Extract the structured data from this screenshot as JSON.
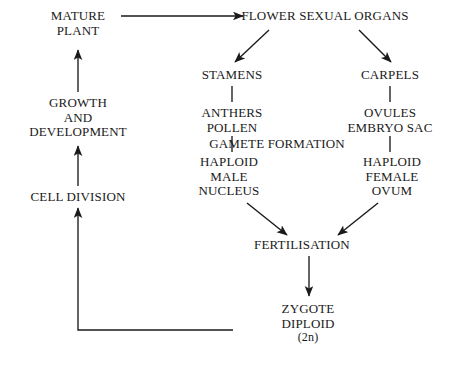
{
  "diagram": {
    "background_color": "#ffffff",
    "line_color": "#1a1a1a",
    "nodes": {
      "mature_plant": {
        "line1": "MATURE",
        "line2": "PLANT"
      },
      "flower_organs": {
        "line1": "FLOWER SEXUAL ORGANS"
      },
      "stamens": {
        "line1": "STAMENS"
      },
      "carpels": {
        "line1": "CARPELS"
      },
      "anthers": {
        "line1": "ANTHERS",
        "line2": "POLLEN"
      },
      "ovules": {
        "line1": "OVULES",
        "line2": "EMBRYO SAC"
      },
      "gamete_formation": {
        "line1": "GAMETE FORMATION"
      },
      "haploid_male": {
        "line1": "HAPLOID",
        "line2": "MALE",
        "line3": "NUCLEUS"
      },
      "haploid_female": {
        "line1": "HAPLOID",
        "line2": "FEMALE",
        "line3": "OVUM"
      },
      "fertilisation": {
        "line1": "FERTILISATION"
      },
      "zygote": {
        "line1": "ZYGOTE",
        "line2": "DIPLOID",
        "line3": "(2n)"
      },
      "growth": {
        "line1": "GROWTH",
        "line2": "AND",
        "line3": "DEVELOPMENT"
      },
      "cell_division": {
        "line1": "CELL DIVISION"
      }
    },
    "edges": [
      {
        "from": "mature_plant",
        "to": "flower_organs",
        "style": "arrow-right"
      },
      {
        "from": "flower_organs",
        "to": "stamens",
        "style": "arrow-diagonal-left"
      },
      {
        "from": "flower_organs",
        "to": "carpels",
        "style": "arrow-diagonal-right"
      },
      {
        "from": "stamens",
        "to": "anthers",
        "style": "plain-vertical"
      },
      {
        "from": "carpels",
        "to": "ovules",
        "style": "plain-vertical"
      },
      {
        "from": "anthers",
        "to": "haploid_male",
        "style": "plain-vertical"
      },
      {
        "from": "ovules",
        "to": "haploid_female",
        "style": "plain-vertical"
      },
      {
        "from": "haploid_male",
        "to": "fertilisation",
        "style": "arrow-diagonal-right"
      },
      {
        "from": "haploid_female",
        "to": "fertilisation",
        "style": "arrow-diagonal-left"
      },
      {
        "from": "fertilisation",
        "to": "zygote",
        "style": "arrow-down"
      },
      {
        "from": "zygote",
        "to": "cell_division",
        "style": "feedback-loop"
      },
      {
        "from": "cell_division",
        "to": "growth",
        "style": "arrow-up"
      },
      {
        "from": "growth",
        "to": "mature_plant",
        "style": "arrow-up"
      }
    ]
  }
}
